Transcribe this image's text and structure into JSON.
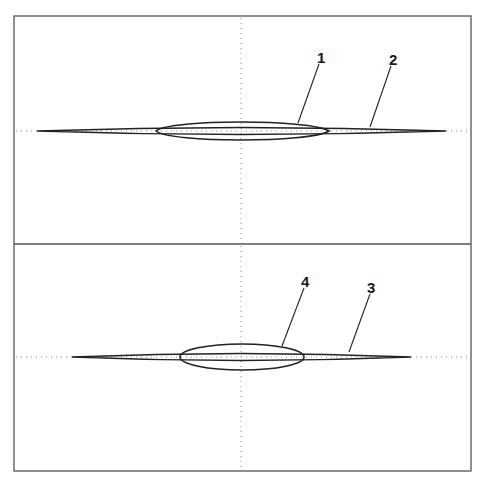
{
  "figure": {
    "panels": [
      {
        "id": "top",
        "axis_y": 131,
        "shapes": [
          {
            "label": "1",
            "type": "ellipse",
            "x_left": 156,
            "x_right": 329,
            "half_height": 10
          },
          {
            "label": "2",
            "type": "spindle",
            "x_left": 37,
            "x_right": 446,
            "half_height": 4
          }
        ],
        "labels": [
          {
            "text": "1",
            "x": 317,
            "y": 62,
            "leader_to": [
              298,
              123
            ]
          },
          {
            "text": "2",
            "x": 389,
            "y": 64,
            "leader_to": [
              370,
              127
            ]
          }
        ]
      },
      {
        "id": "bottom",
        "axis_y": 357,
        "shapes": [
          {
            "label": "4",
            "type": "ellipse",
            "x_left": 180,
            "x_right": 304,
            "half_height": 13
          },
          {
            "label": "3",
            "type": "spindle",
            "x_left": 72,
            "x_right": 411,
            "half_height": 4
          }
        ],
        "labels": [
          {
            "text": "4",
            "x": 302,
            "y": 286,
            "leader_to": [
              282,
              346
            ]
          },
          {
            "text": "3",
            "x": 368,
            "y": 292,
            "leader_to": [
              349,
              352
            ]
          }
        ]
      }
    ]
  },
  "labels": {
    "one": "1",
    "two": "2",
    "three": "3",
    "four": "4"
  }
}
